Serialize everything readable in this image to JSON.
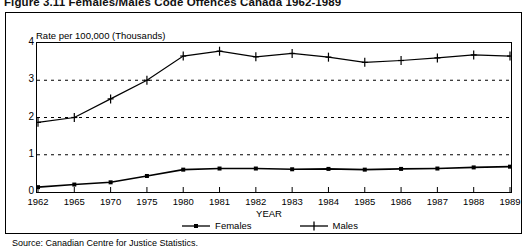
{
  "figure": {
    "title": "Figure 3.11 Females/Males Code Offences Canada 1962-1989",
    "source": "Source: Canadian Centre for Justice Statistics."
  },
  "chart_data": {
    "type": "line",
    "title": "Figure 3.11 Females/Males Code Offences Canada 1962-1989",
    "xlabel": "YEAR",
    "ylabel": "Rate per 100,000 (Thousands)",
    "categories": [
      "1962",
      "1965",
      "1970",
      "1975",
      "1980",
      "1981",
      "1982",
      "1983",
      "1984",
      "1985",
      "1986",
      "1987",
      "1988",
      "1989"
    ],
    "series": [
      {
        "name": "Females",
        "marker": "square",
        "values": [
          0.13,
          0.2,
          0.26,
          0.43,
          0.6,
          0.63,
          0.63,
          0.61,
          0.62,
          0.6,
          0.62,
          0.63,
          0.66,
          0.68
        ]
      },
      {
        "name": "Males",
        "marker": "plus",
        "values": [
          1.87,
          2.0,
          2.5,
          3.0,
          3.65,
          3.78,
          3.63,
          3.72,
          3.62,
          3.48,
          3.53,
          3.6,
          3.68,
          3.65
        ]
      }
    ],
    "ylim": [
      0,
      4
    ],
    "yticks": [
      "0",
      "1",
      "2",
      "3",
      "4"
    ],
    "grid": "horizontal-dashed",
    "legend_position": "bottom",
    "legend": [
      "Females",
      "Males"
    ]
  }
}
